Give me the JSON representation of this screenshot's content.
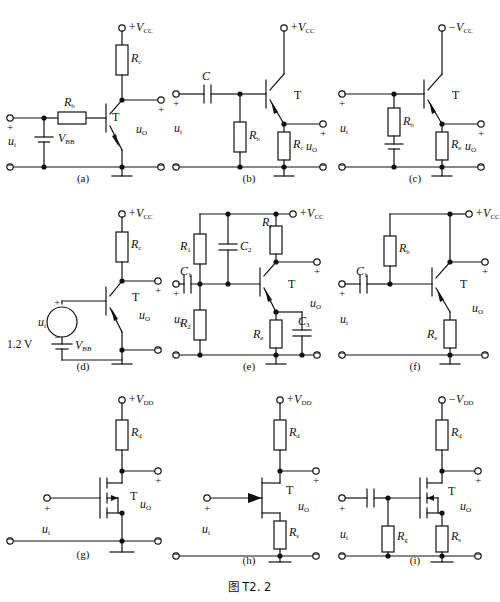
{
  "figure": {
    "caption": "图 T2. 2",
    "width": 499,
    "height": 602,
    "line_color": "#111111",
    "background": "#ffffff"
  },
  "common_labels": {
    "input": "u",
    "input_sub": "i",
    "output": "u",
    "output_sub": "O",
    "transistor": "T",
    "plus": "+",
    "minus": "−"
  },
  "circuits": [
    {
      "id": "a",
      "caption": "(a)",
      "supply": "+V",
      "supply_sub": "CC",
      "device": "bjt-npn",
      "input_label": "u",
      "input_sub": "i",
      "output_label": "u",
      "output_sub": "O",
      "transistor_label": "T",
      "components": [
        {
          "name": "Rc",
          "letter": "R",
          "sub": "c",
          "type": "resistor"
        },
        {
          "name": "Rb",
          "letter": "R",
          "sub": "b",
          "type": "resistor"
        },
        {
          "name": "VBB",
          "letter": "V",
          "sub": "BB",
          "type": "battery"
        }
      ]
    },
    {
      "id": "b",
      "caption": "(b)",
      "supply": "+V",
      "supply_sub": "CC",
      "device": "bjt-pnp",
      "input_label": "u",
      "input_sub": "i",
      "output_label": "u",
      "output_sub": "O",
      "transistor_label": "T",
      "components": [
        {
          "name": "C",
          "letter": "C",
          "sub": "",
          "type": "capacitor"
        },
        {
          "name": "Rb",
          "letter": "R",
          "sub": "b",
          "type": "resistor"
        },
        {
          "name": "Rc",
          "letter": "R",
          "sub": "c",
          "type": "resistor"
        }
      ]
    },
    {
      "id": "c",
      "caption": "(c)",
      "supply": "−V",
      "supply_sub": "CC",
      "device": "bjt-pnp",
      "input_label": "u",
      "input_sub": "i",
      "output_label": "u",
      "output_sub": "O",
      "transistor_label": "T",
      "components": [
        {
          "name": "Rb",
          "letter": "R",
          "sub": "b",
          "type": "resistor"
        },
        {
          "name": "battery",
          "letter": "",
          "sub": "",
          "type": "battery"
        },
        {
          "name": "Re",
          "letter": "R",
          "sub": "e",
          "type": "resistor"
        }
      ]
    },
    {
      "id": "d",
      "caption": "(d)",
      "supply": "+V",
      "supply_sub": "CC",
      "device": "bjt-pnp",
      "input_label": "u",
      "input_sub": "i",
      "output_label": "u",
      "output_sub": "O",
      "transistor_label": "T",
      "source_value": "1.2 V",
      "components": [
        {
          "name": "Rc",
          "letter": "R",
          "sub": "c",
          "type": "resistor"
        },
        {
          "name": "VBB",
          "letter": "V",
          "sub": "BB",
          "type": "battery"
        },
        {
          "name": "ui-source",
          "letter": "u",
          "sub": "i",
          "type": "ac-source"
        }
      ]
    },
    {
      "id": "e",
      "caption": "(e)",
      "supply": "+V",
      "supply_sub": "CC",
      "device": "bjt-pnp",
      "input_label": "u",
      "input_sub": "i",
      "output_label": "u",
      "output_sub": "O",
      "transistor_label": "T",
      "components": [
        {
          "name": "R1",
          "letter": "R",
          "sub": "1",
          "type": "resistor"
        },
        {
          "name": "R2",
          "letter": "R",
          "sub": "2",
          "type": "resistor"
        },
        {
          "name": "Rc",
          "letter": "R",
          "sub": "c",
          "type": "resistor"
        },
        {
          "name": "Re",
          "letter": "R",
          "sub": "e",
          "type": "resistor"
        },
        {
          "name": "C1",
          "letter": "C",
          "sub": "1",
          "type": "capacitor"
        },
        {
          "name": "C2",
          "letter": "C",
          "sub": "2",
          "type": "capacitor"
        },
        {
          "name": "C3",
          "letter": "C",
          "sub": "3",
          "type": "capacitor"
        }
      ]
    },
    {
      "id": "f",
      "caption": "(f)",
      "supply": "+V",
      "supply_sub": "CC",
      "device": "bjt-pnp",
      "input_label": "u",
      "input_sub": "i",
      "output_label": "u",
      "output_sub": "O",
      "transistor_label": "T",
      "components": [
        {
          "name": "Rb",
          "letter": "R",
          "sub": "b",
          "type": "resistor"
        },
        {
          "name": "Re",
          "letter": "R",
          "sub": "e",
          "type": "resistor"
        },
        {
          "name": "C1",
          "letter": "C",
          "sub": "1",
          "type": "capacitor"
        }
      ]
    },
    {
      "id": "g",
      "caption": "(g)",
      "supply": "+V",
      "supply_sub": "DD",
      "device": "mosfet-n",
      "input_label": "u",
      "input_sub": "i",
      "output_label": "u",
      "output_sub": "O",
      "transistor_label": "T",
      "components": [
        {
          "name": "Rd",
          "letter": "R",
          "sub": "d",
          "type": "resistor"
        }
      ]
    },
    {
      "id": "h",
      "caption": "(h)",
      "supply": "+V",
      "supply_sub": "DD",
      "device": "jfet-n",
      "input_label": "u",
      "input_sub": "i",
      "output_label": "u",
      "output_sub": "O",
      "transistor_label": "T",
      "components": [
        {
          "name": "Rd",
          "letter": "R",
          "sub": "d",
          "type": "resistor"
        },
        {
          "name": "Rs",
          "letter": "R",
          "sub": "s",
          "type": "resistor"
        }
      ]
    },
    {
      "id": "i",
      "caption": "(i)",
      "supply": "−V",
      "supply_sub": "DD",
      "device": "mosfet-p",
      "input_label": "u",
      "input_sub": "i",
      "output_label": "u",
      "output_sub": "O",
      "transistor_label": "T",
      "components": [
        {
          "name": "Rd",
          "letter": "R",
          "sub": "d",
          "type": "resistor"
        },
        {
          "name": "Rg",
          "letter": "R",
          "sub": "g",
          "type": "resistor"
        },
        {
          "name": "Rs",
          "letter": "R",
          "sub": "s",
          "type": "resistor"
        },
        {
          "name": "C",
          "letter": "",
          "sub": "",
          "type": "capacitor"
        }
      ]
    }
  ]
}
